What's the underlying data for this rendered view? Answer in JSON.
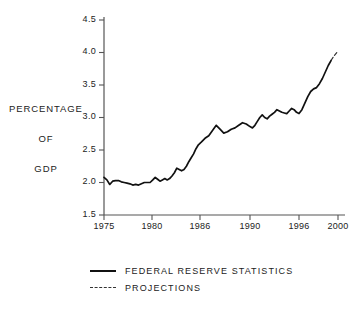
{
  "chart_data": {
    "type": "line",
    "title": "",
    "xlabel": "",
    "ylabel": "PERCENTAGE OF GDP",
    "ylabel_lines": [
      "PERCENTAGE",
      "OF",
      "GDP"
    ],
    "xlim": [
      1975,
      2000
    ],
    "ylim": [
      1.5,
      4.5
    ],
    "grid": false,
    "legend_position": "below",
    "ytick_labels": [
      "4.5",
      "4.0",
      "3.5",
      "3.0",
      "2.5",
      "2.0",
      "1.5"
    ],
    "ytick_values": [
      4.5,
      4.0,
      3.5,
      3.0,
      2.5,
      2.0,
      1.5
    ],
    "xtick_labels": [
      "1975",
      "1980",
      "1986",
      "1990",
      "1996",
      "2000"
    ],
    "xtick_values": [
      1975,
      1980,
      1986,
      1990,
      1996,
      2000
    ],
    "xtick_pixels": [
      104,
      152,
      200,
      250,
      299,
      338
    ],
    "series": [
      {
        "name": "FEDERAL RESERVE STATISTICS",
        "style": "solid",
        "color": "#111111",
        "x": [
          1975.0,
          1975.3,
          1975.6,
          1975.9,
          1976.2,
          1976.5,
          1976.8,
          1977.1,
          1977.4,
          1977.7,
          1978.0,
          1978.3,
          1978.6,
          1978.9,
          1979.2,
          1979.5,
          1979.8,
          1980.1,
          1980.4,
          1980.7,
          1981.0,
          1981.3,
          1981.6,
          1981.9,
          1982.2,
          1982.5,
          1982.8,
          1983.1,
          1983.4,
          1983.7,
          1984.0,
          1984.3,
          1984.6,
          1984.9,
          1985.2,
          1985.5,
          1985.8,
          1986.1,
          1986.4,
          1986.7,
          1987.0,
          1987.3,
          1987.6,
          1987.9,
          1988.2,
          1988.5,
          1988.8,
          1989.1,
          1989.4,
          1989.7,
          1990.0,
          1990.3,
          1990.6,
          1990.9,
          1991.2,
          1991.5,
          1991.8,
          1992.1,
          1992.4,
          1992.7,
          1993.0,
          1993.3,
          1993.6,
          1993.9,
          1994.2,
          1994.5,
          1994.8,
          1995.1,
          1995.4,
          1995.7,
          1996.0,
          1996.3,
          1996.6,
          1996.9,
          1997.2,
          1997.5,
          1997.8,
          1998.1,
          1998.4,
          1998.7,
          1999.0,
          1999.3
        ],
        "y": [
          2.08,
          2.04,
          1.97,
          2.02,
          2.03,
          2.03,
          2.01,
          2.0,
          1.99,
          1.98,
          1.96,
          1.97,
          1.96,
          1.98,
          2.0,
          2.0,
          2.0,
          2.04,
          2.08,
          2.05,
          2.02,
          2.04,
          2.06,
          2.04,
          2.06,
          2.1,
          2.15,
          2.22,
          2.2,
          2.18,
          2.2,
          2.25,
          2.32,
          2.38,
          2.44,
          2.52,
          2.58,
          2.62,
          2.68,
          2.72,
          2.8,
          2.88,
          2.82,
          2.76,
          2.78,
          2.82,
          2.84,
          2.88,
          2.92,
          2.9,
          2.86,
          2.84,
          2.88,
          2.94,
          3.0,
          3.04,
          3.0,
          2.98,
          3.02,
          3.05,
          3.08,
          3.12,
          3.1,
          3.08,
          3.07,
          3.06,
          3.1,
          3.14,
          3.12,
          3.08,
          3.06,
          3.12,
          3.22,
          3.32,
          3.4,
          3.44,
          3.46,
          3.52,
          3.6,
          3.7,
          3.8,
          3.88
        ]
      },
      {
        "name": "PROJECTIONS",
        "style": "dashed",
        "color": "#333333",
        "x": [
          1999.3,
          1999.6,
          2000.0
        ],
        "y": [
          3.88,
          3.95,
          4.02
        ]
      }
    ]
  },
  "legend": {
    "items": [
      {
        "label": "FEDERAL RESERVE STATISTICS",
        "style": "solid"
      },
      {
        "label": "PROJECTIONS",
        "style": "dashed"
      }
    ]
  },
  "colors": {
    "background": "#ffffff",
    "axis": "#555555",
    "data_line": "#111111",
    "projection_line": "#333333",
    "text": "#222222"
  }
}
